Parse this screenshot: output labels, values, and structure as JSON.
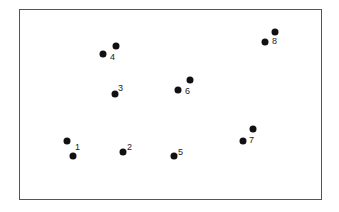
{
  "diagram": {
    "frame_color": "#555555",
    "dot_color": "#111111",
    "groups": [
      {
        "label": "1",
        "dots": [
          [
            67,
            141
          ],
          [
            73,
            156
          ]
        ],
        "label_pos": [
          75,
          147
        ]
      },
      {
        "label": "2",
        "dots": [
          [
            123,
            152
          ]
        ],
        "label_pos": [
          127,
          147
        ]
      },
      {
        "label": "3",
        "dots": [
          [
            115,
            94
          ]
        ],
        "label_pos": [
          118,
          88
        ]
      },
      {
        "label": "4",
        "dots": [
          [
            103,
            54
          ],
          [
            116,
            46
          ]
        ],
        "label_pos": [
          110,
          57
        ]
      },
      {
        "label": "5",
        "dots": [
          [
            174,
            156
          ]
        ],
        "label_pos": [
          178,
          152
        ]
      },
      {
        "label": "6",
        "dots": [
          [
            178,
            90
          ],
          [
            190,
            80
          ]
        ],
        "label_pos": [
          185,
          91
        ]
      },
      {
        "label": "7",
        "dots": [
          [
            243,
            141
          ],
          [
            253,
            129
          ]
        ],
        "label_pos": [
          249,
          140
        ]
      },
      {
        "label": "8",
        "dots": [
          [
            265,
            42
          ],
          [
            275,
            32
          ]
        ],
        "label_pos": [
          272,
          41
        ]
      }
    ]
  }
}
